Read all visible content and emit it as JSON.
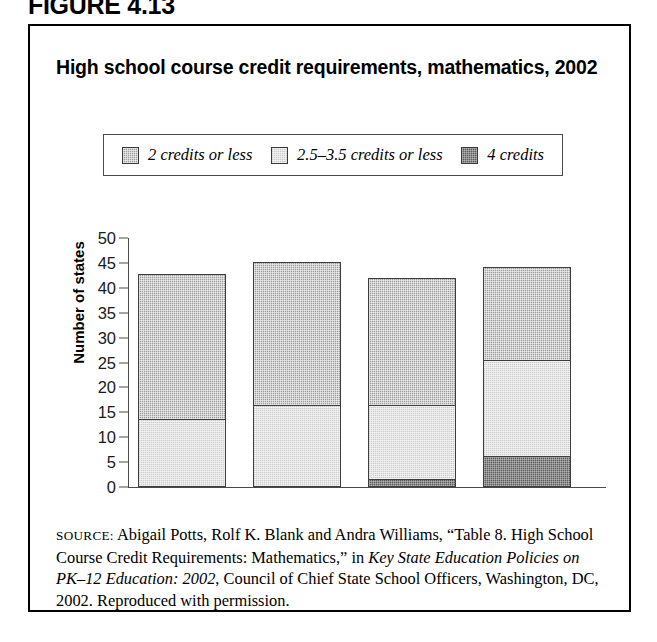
{
  "figure_label": "FIGURE 4.13",
  "chart_title": "High school course credit requirements, mathematics, 2002",
  "legend": {
    "items": [
      {
        "label": "2 credits or less",
        "fill": "medium",
        "color": "#9d9d9d"
      },
      {
        "label": "2.5–3.5 credits or less",
        "fill": "light",
        "color": "#e4e4e4"
      },
      {
        "label": "4 credits",
        "fill": "dark",
        "color": "#5a5a5a"
      }
    ]
  },
  "source": {
    "prefix": "SOURCE:",
    "part1": " Abigail Potts, Rolf K. Blank and Andra Williams, “Table 8. High School Course Credit Requirements: Mathematics,” in ",
    "italic1": "Key State Education Policies on PK–12 Education: 2002",
    "part2": ", Council of Chief State School Officers, Washington, DC, 2002. Reproduced with permission."
  },
  "chart_data": {
    "type": "bar",
    "subtype": "stacked",
    "title": "High school course credit requirements, mathematics, 2002",
    "xlabel": "",
    "ylabel": "Number of states",
    "ylim": [
      0,
      50
    ],
    "yticks": [
      0,
      5,
      10,
      15,
      20,
      25,
      30,
      35,
      40,
      45,
      50
    ],
    "grid": false,
    "legend_position": "top",
    "categories": [
      "Bar 1",
      "Bar 2",
      "Bar 3",
      "Bar 4"
    ],
    "category_labels_shown": false,
    "series": [
      {
        "name": "4 credits",
        "values": [
          0,
          0,
          1.5,
          6
        ]
      },
      {
        "name": "2.5–3.5 credits or less",
        "values": [
          13.5,
          16.3,
          14.8,
          19.3
        ]
      },
      {
        "name": "2 credits or less",
        "values": [
          29,
          28.7,
          25.5,
          18.7
        ]
      }
    ],
    "cumulative_tops": [
      42.5,
      45,
      41.8,
      44
    ]
  }
}
